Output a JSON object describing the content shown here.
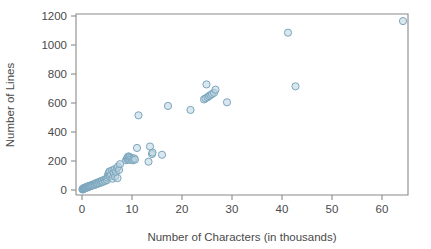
{
  "chart_data": {
    "type": "scatter",
    "title": "",
    "subtitle": "",
    "xlabel": "Number of Characters (in thousands)",
    "ylabel": "Number of Lines",
    "xlim": [
      -1.5,
      66
    ],
    "ylim": [
      -45,
      1235
    ],
    "xticks": [
      0,
      10,
      20,
      30,
      40,
      50,
      60
    ],
    "xticklabels": [
      "0",
      "10",
      "20",
      "30",
      "40",
      "50",
      "60"
    ],
    "yticks": [
      0,
      200,
      400,
      600,
      800,
      1000,
      1200
    ],
    "yticklabels": [
      "0",
      "200",
      "400",
      "600",
      "800",
      "1000",
      "1200"
    ],
    "grid": false,
    "legend": null,
    "marker": {
      "shape": "circle-open",
      "radius_px": 3.6,
      "stroke_color": "#7ba6bd",
      "fill_color": "#bcd4e0",
      "fill_opacity": 0.55
    },
    "series": [
      {
        "name": "files",
        "points": [
          [
            0.1,
            4
          ],
          [
            0.15,
            6
          ],
          [
            0.2,
            8
          ],
          [
            0.25,
            5
          ],
          [
            0.3,
            10
          ],
          [
            0.35,
            12
          ],
          [
            0.4,
            9
          ],
          [
            0.45,
            14
          ],
          [
            0.5,
            11
          ],
          [
            0.55,
            16
          ],
          [
            0.6,
            13
          ],
          [
            0.7,
            18
          ],
          [
            0.8,
            15
          ],
          [
            0.9,
            20
          ],
          [
            1.0,
            22
          ],
          [
            1.1,
            17
          ],
          [
            1.2,
            25
          ],
          [
            1.3,
            21
          ],
          [
            1.4,
            28
          ],
          [
            1.5,
            24
          ],
          [
            1.6,
            30
          ],
          [
            1.8,
            27
          ],
          [
            1.9,
            34
          ],
          [
            2.0,
            31
          ],
          [
            2.2,
            38
          ],
          [
            2.3,
            33
          ],
          [
            2.5,
            42
          ],
          [
            2.6,
            36
          ],
          [
            2.8,
            46
          ],
          [
            2.9,
            40
          ],
          [
            3.0,
            50
          ],
          [
            3.2,
            44
          ],
          [
            3.4,
            55
          ],
          [
            3.5,
            48
          ],
          [
            3.7,
            60
          ],
          [
            3.9,
            52
          ],
          [
            4.0,
            64
          ],
          [
            4.2,
            57
          ],
          [
            4.4,
            70
          ],
          [
            4.6,
            62
          ],
          [
            4.8,
            76
          ],
          [
            5.0,
            68
          ],
          [
            5.1,
            86
          ],
          [
            5.2,
            100
          ],
          [
            5.3,
            112
          ],
          [
            5.4,
            120
          ],
          [
            5.5,
            128
          ],
          [
            5.6,
            95
          ],
          [
            5.8,
            108
          ],
          [
            6.0,
            135
          ],
          [
            6.1,
            78
          ],
          [
            6.3,
            118
          ],
          [
            6.5,
            143
          ],
          [
            6.6,
            92
          ],
          [
            6.8,
            125
          ],
          [
            7.0,
            150
          ],
          [
            7.1,
            82
          ],
          [
            7.2,
            162
          ],
          [
            7.4,
            138
          ],
          [
            7.6,
            178
          ],
          [
            8.8,
            205
          ],
          [
            9.0,
            215
          ],
          [
            9.1,
            225
          ],
          [
            9.2,
            210
          ],
          [
            9.3,
            232
          ],
          [
            9.4,
            218
          ],
          [
            9.5,
            228
          ],
          [
            9.6,
            208
          ],
          [
            9.8,
            222
          ],
          [
            10.0,
            212
          ],
          [
            10.2,
            205
          ],
          [
            10.4,
            218
          ],
          [
            10.6,
            210
          ],
          [
            11.0,
            290
          ],
          [
            11.3,
            515
          ],
          [
            13.3,
            195
          ],
          [
            13.6,
            300
          ],
          [
            14.0,
            248
          ],
          [
            14.1,
            258
          ],
          [
            16.0,
            243
          ],
          [
            17.2,
            580
          ],
          [
            21.7,
            552
          ],
          [
            24.4,
            625
          ],
          [
            24.7,
            632
          ],
          [
            24.9,
            728
          ],
          [
            25.1,
            640
          ],
          [
            25.4,
            648
          ],
          [
            25.7,
            655
          ],
          [
            26.0,
            662
          ],
          [
            26.4,
            670
          ],
          [
            26.7,
            692
          ],
          [
            29.0,
            605
          ],
          [
            41.2,
            1085
          ],
          [
            42.7,
            715
          ],
          [
            64.2,
            1165
          ]
        ]
      }
    ]
  },
  "axes_geometry": {
    "plot_left_px": 76,
    "plot_right_px": 408,
    "plot_top_px": 14,
    "plot_bottom_px": 195,
    "x_zero_px": 82,
    "x_units_per_px": 0.2,
    "y_zero_px": 190,
    "y_px_per_unit": 0.145
  }
}
